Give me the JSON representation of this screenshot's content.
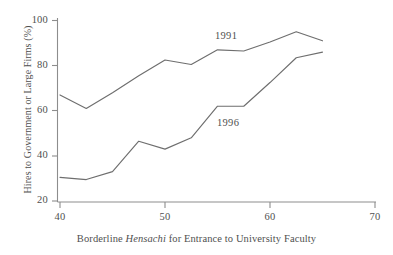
{
  "chart_data": {
    "type": "line",
    "title": "",
    "subtitle": "",
    "xlabel_plain_prefix": "Borderline ",
    "xlabel_italic": "Hensachi",
    "xlabel_plain_suffix": " for Entrance to University Faculty",
    "xlabel": "Borderline Hensachi for Entrance to University Faculty",
    "ylabel": "Hires to Government or Large Firms (%)",
    "xlim": [
      40,
      70
    ],
    "ylim": [
      20,
      100
    ],
    "xticks": [
      40,
      50,
      60,
      70
    ],
    "yticks": [
      20,
      40,
      60,
      80,
      100
    ],
    "xtick_labels": [
      "40",
      "50",
      "60",
      "70"
    ],
    "ytick_labels": [
      "20",
      "40",
      "60",
      "80",
      "100"
    ],
    "grid": false,
    "legend": "inline-annotations",
    "line_color": "#6e6e6e",
    "axis_color": "#8a8a8a",
    "text_color": "#4f4f4f",
    "series": [
      {
        "name": "1991",
        "annotation_label": "1991",
        "x": [
          40,
          42.5,
          45,
          47.5,
          50,
          52.5,
          55,
          57.5,
          60,
          62.5,
          65
        ],
        "values": [
          67,
          61,
          68,
          75.5,
          82.5,
          80.5,
          87,
          86.5,
          90.5,
          95,
          91
        ]
      },
      {
        "name": "1996",
        "annotation_label": "1996",
        "x": [
          40,
          42.5,
          45,
          47.5,
          50,
          52.5,
          55,
          57.5,
          60,
          62.5,
          65
        ],
        "values": [
          30.5,
          29.5,
          33,
          46.5,
          43,
          48,
          62,
          62,
          72.5,
          83.5,
          86
        ]
      }
    ]
  },
  "axes": {
    "y_title": "Hires to Government or Large Firms (%)",
    "x_title_prefix": "Borderline ",
    "x_title_italic": "Hensachi",
    "x_title_suffix": " for Entrance to University Faculty",
    "y_tick_0": "100",
    "y_tick_1": "80",
    "y_tick_2": "60",
    "y_tick_3": "40",
    "y_tick_4": "20",
    "x_tick_0": "40",
    "x_tick_1": "50",
    "x_tick_2": "60",
    "x_tick_3": "70"
  },
  "annotations": {
    "series_1991": "1991",
    "series_1996": "1996"
  }
}
